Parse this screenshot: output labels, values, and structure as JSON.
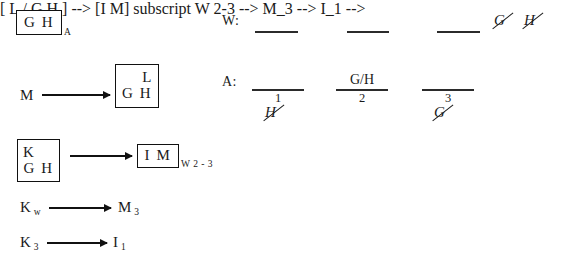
{
  "left_column": {
    "item1": {
      "box_text": "G H",
      "subscript": "A"
    },
    "item2": {
      "source": "M",
      "box_top": "L",
      "box_bottom": "G H"
    },
    "item3": {
      "box_top": "K",
      "box_bottom": "G H",
      "target_box": "I M",
      "target_subscript": "W 2 - 3"
    },
    "item4": {
      "source": "K",
      "source_subscript": "w",
      "target": "M",
      "target_subscript": "3"
    },
    "item5": {
      "source": "K",
      "source_subscript": "3",
      "target": "I",
      "target_subscript": "1"
    }
  },
  "right_column": {
    "w_row": {
      "label": "W:",
      "slots": [
        "",
        "",
        ""
      ],
      "struck_letters": [
        "G",
        "H"
      ]
    },
    "a_row": {
      "label": "A:",
      "slots": [
        {
          "above": "",
          "number": "1",
          "struck_below": "H"
        },
        {
          "above": "G/H",
          "number": "2",
          "struck_below": ""
        },
        {
          "above": "",
          "number": "3",
          "struck_below": "G"
        }
      ]
    }
  },
  "colors": {
    "ink": "#1a1a1a",
    "rule": "#2b2b2b",
    "background": "#ffffff"
  }
}
